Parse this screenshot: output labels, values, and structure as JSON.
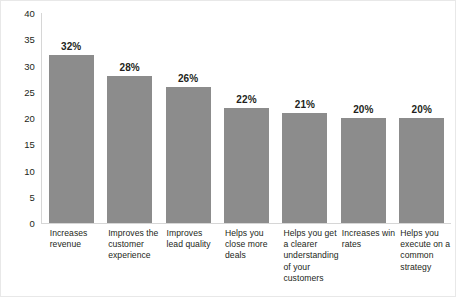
{
  "chart_data": {
    "type": "bar",
    "title": "",
    "subtitle": "",
    "xlabel": "",
    "ylabel": "",
    "ylim": [
      0,
      40
    ],
    "yticks": [
      0,
      5,
      10,
      15,
      20,
      25,
      30,
      35,
      40
    ],
    "ytick_labels": [
      "0",
      "5",
      "10",
      "15",
      "20",
      "25",
      "30",
      "35",
      "40"
    ],
    "grid": false,
    "legend": null,
    "bar_color": "#8c8c8c",
    "text_color": "#231f20",
    "axis_color": "#d6d6d6",
    "categories": [
      "Increases revenue",
      "Improves the customer experience",
      "Improves lead quality",
      "Helps you close more deals",
      "Helps you get a clearer understanding of your customers",
      "Increases win rates",
      "Helps you execute on a common strategy"
    ],
    "values": [
      32,
      28,
      26,
      22,
      21,
      20,
      20
    ],
    "data_labels": [
      "32%",
      "28%",
      "26%",
      "22%",
      "21%",
      "20%",
      "20%"
    ]
  }
}
